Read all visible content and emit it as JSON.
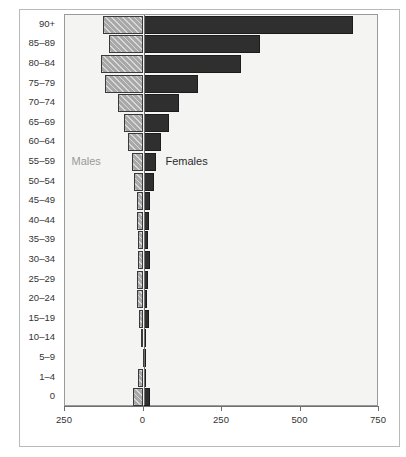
{
  "chart_data": {
    "type": "bar",
    "orientation": "horizontal",
    "subtype": "population-pyramid",
    "title": "",
    "xlabel": "",
    "ylabel": "Year",
    "grid": false,
    "legend_position": "inside-plot",
    "xlim": [
      -250,
      750
    ],
    "xticks": [
      -250,
      0,
      250,
      500,
      750
    ],
    "xtick_labels": [
      "250",
      "0",
      "250",
      "500",
      "750"
    ],
    "categories": [
      "90+",
      "85–89",
      "80–84",
      "75–79",
      "70–74",
      "65–69",
      "60–64",
      "55–59",
      "50–54",
      "45–49",
      "40–44",
      "35–39",
      "30–34",
      "25–29",
      "20–24",
      "15–19",
      "10–14",
      "5–9",
      "1–4",
      "0"
    ],
    "series": [
      {
        "name": "Males",
        "color": "#a8a8a8",
        "direction": "left",
        "values": [
          130,
          110,
          135,
          122,
          82,
          62,
          50,
          38,
          30,
          22,
          20,
          18,
          17,
          22,
          22,
          14,
          8,
          2,
          18,
          35
        ]
      },
      {
        "name": "Females",
        "color": "#2f2f2f",
        "direction": "right",
        "values": [
          668,
          370,
          310,
          175,
          112,
          80,
          57,
          40,
          32,
          20,
          16,
          14,
          20,
          15,
          12,
          18,
          7,
          2,
          4,
          22
        ]
      }
    ],
    "annotations": [
      {
        "text": "Males",
        "color": "#9a9a9a"
      },
      {
        "text": "Females",
        "color": "#2b2b2b"
      }
    ]
  },
  "axis": {
    "y_title_clipped": "Year"
  }
}
